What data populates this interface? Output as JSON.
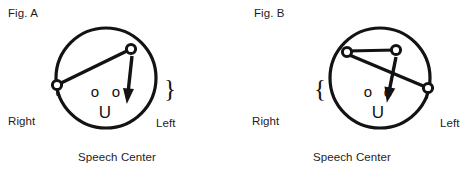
{
  "page": {
    "background_color": "#ffffff",
    "ink_color": "#131313",
    "width": 469,
    "height": 176
  },
  "figures": [
    {
      "id": "fig-a",
      "title": "Fig. A",
      "caption": "Speech Center",
      "left_label": "Left",
      "right_label": "Right",
      "brace_glyph": "}",
      "brace_side": "right",
      "face": {
        "eye_left": "o",
        "eye_right": "o",
        "mouth": "U"
      },
      "head": {
        "cx": 106,
        "cy": 78,
        "r": 50,
        "stroke_width": 3.2
      },
      "nodes": [
        {
          "name": "node-top",
          "cx": 131,
          "cy": 49,
          "r": 4.6
        },
        {
          "name": "node-right-edge",
          "cx": 57,
          "cy": 85,
          "r": 4.6
        }
      ],
      "connector": {
        "x1": 57,
        "y1": 85,
        "x2": 131,
        "y2": 49,
        "stroke_width": 3.4
      },
      "arrow": {
        "x1": 132,
        "y1": 56,
        "x2": 128,
        "y2": 93,
        "stroke_width": 3.4,
        "head_length": 13,
        "head_width": 11
      }
    },
    {
      "id": "fig-b",
      "title": "Fig. B",
      "caption": "Speech Center",
      "left_label": "Left",
      "right_label": "Right",
      "brace_glyph": "{",
      "brace_side": "left",
      "face": {
        "eye_left": "o",
        "eye_right": "o",
        "mouth": "U"
      },
      "head": {
        "cx": 380,
        "cy": 78,
        "r": 50,
        "stroke_width": 3.2
      },
      "nodes": [
        {
          "name": "node-top-left",
          "cx": 347,
          "cy": 52,
          "r": 4.6
        },
        {
          "name": "node-top-right",
          "cx": 396,
          "cy": 50,
          "r": 4.6
        },
        {
          "name": "node-right-edge",
          "cx": 428,
          "cy": 88,
          "r": 4.6
        }
      ],
      "connector_top": {
        "x1": 347,
        "y1": 51,
        "x2": 396,
        "y2": 50,
        "stroke_width": 3.2
      },
      "connector_diagonal": {
        "x1": 347,
        "y1": 54,
        "x2": 428,
        "y2": 88,
        "stroke_width": 3.4
      },
      "arrow": {
        "x1": 396,
        "y1": 57,
        "x2": 389,
        "y2": 92,
        "stroke_width": 3.4,
        "head_length": 13,
        "head_width": 11
      }
    }
  ]
}
